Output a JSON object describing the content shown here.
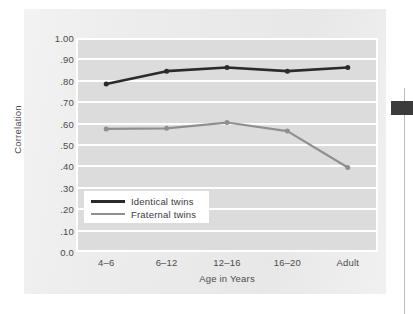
{
  "figure": {
    "background_color": "#ececec",
    "plot_background_color": "#dcdcdc",
    "gridline_color": "#ffffff",
    "page_edge_mark_color": "#3b3b3b",
    "page_edge_line_color": "#b9b9b9"
  },
  "chart_data": {
    "type": "line",
    "title": "",
    "xlabel": "Age in Years",
    "ylabel": "Correlation",
    "categories": [
      "4–6",
      "6–12",
      "12–16",
      "16–20",
      "Adult"
    ],
    "ylim": [
      0.0,
      1.0
    ],
    "ytick_values": [
      1.0,
      0.9,
      0.8,
      0.7,
      0.6,
      0.5,
      0.4,
      0.3,
      0.2,
      0.1,
      0.0
    ],
    "ytick_labels": [
      "1.00",
      ".90",
      ".80",
      ".70",
      ".60",
      ".50",
      ".40",
      ".30",
      ".20",
      ".10",
      "0.0"
    ],
    "grid": true,
    "grid_axis": "y",
    "legend_position": "lower-left-inside",
    "series": [
      {
        "name": "Identical twins",
        "color": "#2b2b2b",
        "line_width": 2.6,
        "marker": "circle",
        "marker_size": 5,
        "values": [
          0.785,
          0.845,
          0.862,
          0.845,
          0.862
        ]
      },
      {
        "name": "Fraternal twins",
        "color": "#8f8f8f",
        "line_width": 2.2,
        "marker": "circle",
        "marker_size": 5,
        "values": [
          0.575,
          0.578,
          0.605,
          0.565,
          0.395
        ]
      }
    ]
  },
  "legend": {
    "entries": [
      {
        "label": "Identical twins",
        "color": "#2b2b2b"
      },
      {
        "label": "Fraternal twins",
        "color": "#8f8f8f"
      }
    ]
  }
}
